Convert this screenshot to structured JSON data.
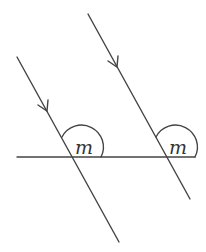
{
  "diagram": {
    "type": "parallel-lines-corresponding-angles",
    "stroke_color": "#444444",
    "horizontal_line": {
      "x1": 17,
      "y1": 157,
      "x2": 195,
      "y2": 157
    },
    "lines": [
      {
        "name": "left-transversal",
        "x1": 17,
        "y1": 57,
        "x2": 119,
        "y2": 242,
        "arrow_at": [
          47,
          110
        ]
      },
      {
        "name": "right-transversal",
        "x1": 88,
        "y1": 14,
        "x2": 190,
        "y2": 199,
        "arrow_at": [
          117,
          66
        ]
      }
    ],
    "angles": [
      {
        "label": "m",
        "vertex": [
          73,
          157
        ]
      },
      {
        "label": "m",
        "vertex": [
          167,
          157
        ]
      }
    ]
  }
}
